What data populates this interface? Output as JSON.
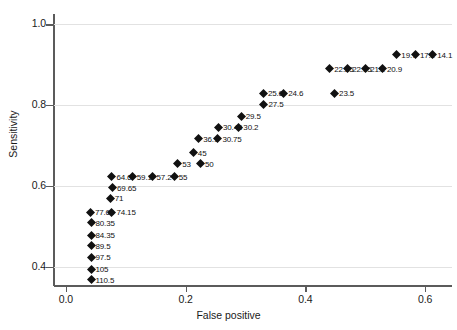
{
  "chart_data": {
    "type": "scatter",
    "title": "",
    "xlabel": "False positive",
    "ylabel": "Sensitivity",
    "xlim": [
      -0.02,
      0.645
    ],
    "ylim": [
      0.355,
      1.025
    ],
    "xticks": [
      "0.0",
      "0.2",
      "0.4",
      "0.6"
    ],
    "xtick_values": [
      0.0,
      0.2,
      0.4,
      0.6
    ],
    "yticks": [
      "0.4",
      "0.6",
      "0.8",
      "1.0"
    ],
    "ytick_values": [
      0.4,
      0.6,
      0.8,
      1.0
    ],
    "grid": "horizontal",
    "legend": "none",
    "marker": "diamond",
    "marker_color": "#111111",
    "points": [
      {
        "label": "19.7",
        "x": 0.552,
        "y": 0.935
      },
      {
        "label": "17.2",
        "x": 0.583,
        "y": 0.935
      },
      {
        "label": "14.1",
        "x": 0.612,
        "y": 0.935
      },
      {
        "label": "22.25",
        "x": 0.44,
        "y": 0.9
      },
      {
        "label": "22.15",
        "x": 0.47,
        "y": 0.9
      },
      {
        "label": "21.2",
        "x": 0.5,
        "y": 0.9
      },
      {
        "label": "20.9",
        "x": 0.528,
        "y": 0.9
      },
      {
        "label": "25.6",
        "x": 0.329,
        "y": 0.839
      },
      {
        "label": "24.6",
        "x": 0.363,
        "y": 0.839
      },
      {
        "label": "23.5",
        "x": 0.448,
        "y": 0.839
      },
      {
        "label": "27.5",
        "x": 0.33,
        "y": 0.812
      },
      {
        "label": "29.5",
        "x": 0.292,
        "y": 0.783
      },
      {
        "label": "30.45",
        "x": 0.254,
        "y": 0.756
      },
      {
        "label": "30.2",
        "x": 0.288,
        "y": 0.756
      },
      {
        "label": "36.1",
        "x": 0.221,
        "y": 0.727
      },
      {
        "label": "30.75",
        "x": 0.253,
        "y": 0.727
      },
      {
        "label": "45",
        "x": 0.212,
        "y": 0.693
      },
      {
        "label": "53",
        "x": 0.186,
        "y": 0.665
      },
      {
        "label": "50",
        "x": 0.224,
        "y": 0.665
      },
      {
        "label": "64.6",
        "x": 0.076,
        "y": 0.633
      },
      {
        "label": "59.1",
        "x": 0.11,
        "y": 0.633
      },
      {
        "label": "57.2",
        "x": 0.143,
        "y": 0.633
      },
      {
        "label": "55",
        "x": 0.18,
        "y": 0.633
      },
      {
        "label": "69.65",
        "x": 0.077,
        "y": 0.606
      },
      {
        "label": "71",
        "x": 0.073,
        "y": 0.58
      },
      {
        "label": "77.65",
        "x": 0.04,
        "y": 0.546
      },
      {
        "label": "74.15",
        "x": 0.076,
        "y": 0.546
      },
      {
        "label": "80.35",
        "x": 0.041,
        "y": 0.519
      },
      {
        "label": "84.35",
        "x": 0.041,
        "y": 0.489
      },
      {
        "label": "89.5",
        "x": 0.041,
        "y": 0.462
      },
      {
        "label": "97.5",
        "x": 0.041,
        "y": 0.434
      },
      {
        "label": "105",
        "x": 0.041,
        "y": 0.404
      },
      {
        "label": "110.5",
        "x": 0.041,
        "y": 0.378
      }
    ]
  }
}
